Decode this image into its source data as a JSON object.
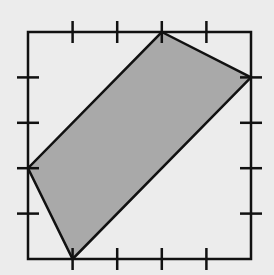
{
  "diagram": {
    "type": "grid-square-with-shaded-quadrilateral",
    "grid": {
      "divisions_per_side": 5,
      "origin_px": [
        28,
        259
      ],
      "unit_px": [
        44.6,
        45.4
      ],
      "tick_length_px": 11
    },
    "square": {
      "corners_units": [
        [
          0,
          0
        ],
        [
          5,
          0
        ],
        [
          5,
          5
        ],
        [
          0,
          5
        ]
      ],
      "stroke": "#111111",
      "stroke_width": 2.5
    },
    "shaded_polygon": {
      "vertices_units": [
        [
          3,
          5
        ],
        [
          5,
          4
        ],
        [
          1,
          0
        ],
        [
          0,
          2
        ]
      ],
      "fill": "#a9a9a9",
      "stroke": "#111111",
      "stroke_width": 2.5
    },
    "colors": {
      "background": "#ececec",
      "line": "#111111",
      "shade": "#a9a9a9"
    }
  }
}
